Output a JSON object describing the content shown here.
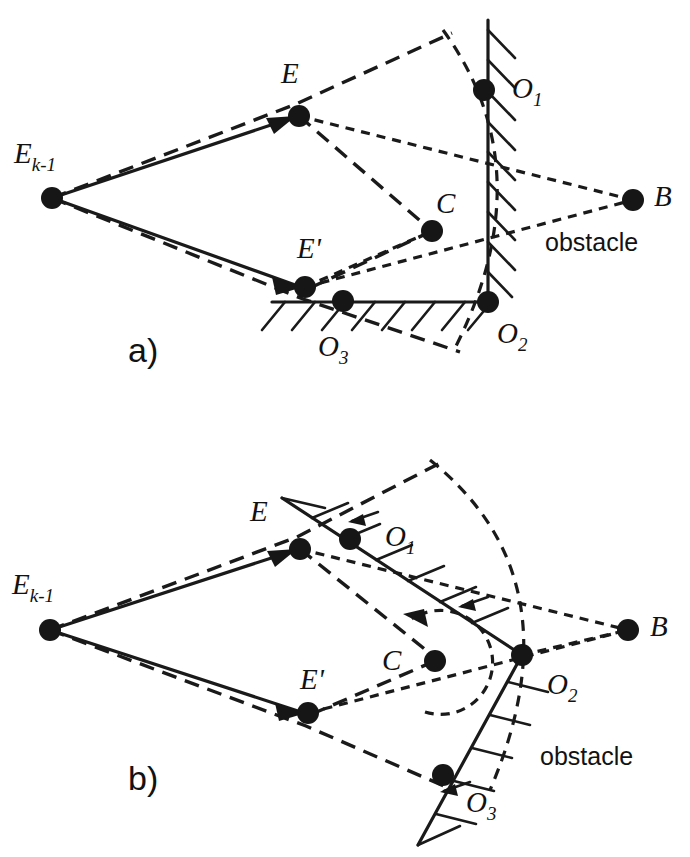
{
  "figure": {
    "background_color": "#ffffff",
    "ink_color": "#161616",
    "panels": [
      {
        "id": "a",
        "label": "a)",
        "label_pos": [
          128,
          362
        ],
        "obstacle_text": "obstacle",
        "obstacle_text_pos": [
          545,
          251
        ],
        "obstacle_shape": "L-corner, vertical arm with hatching on right, horizontal arm with hatching below",
        "nodes": [
          {
            "name": "E_k-1",
            "label": "E",
            "sub": "k-1",
            "x": 52,
            "y": 198,
            "label_x": 14,
            "label_y": 163,
            "r": 10
          },
          {
            "name": "E",
            "label": "E",
            "sub": "",
            "x": 299,
            "y": 116,
            "label_x": 281,
            "label_y": 83,
            "r": 11
          },
          {
            "name": "E_prime",
            "label": "E'",
            "sub": "",
            "x": 305,
            "y": 287,
            "label_x": 297,
            "label_y": 258,
            "r": 11
          },
          {
            "name": "C",
            "label": "C",
            "sub": "",
            "x": 432,
            "y": 231,
            "label_x": 436,
            "label_y": 213,
            "r": 11
          },
          {
            "name": "O_1",
            "label": "O",
            "sub": "1",
            "x": 484,
            "y": 90,
            "label_x": 512,
            "label_y": 98,
            "r": 11
          },
          {
            "name": "O_2",
            "label": "O",
            "sub": "2",
            "x": 488,
            "y": 302,
            "label_x": 497,
            "label_y": 343,
            "r": 11
          },
          {
            "name": "O_3",
            "label": "O",
            "sub": "3",
            "x": 343,
            "y": 301,
            "label_x": 318,
            "label_y": 356,
            "r": 11
          },
          {
            "name": "B",
            "label": "B",
            "sub": "",
            "x": 633,
            "y": 200,
            "label_x": 654,
            "label_y": 206,
            "r": 11
          }
        ]
      },
      {
        "id": "b",
        "label": "b)",
        "label_pos": [
          128,
          790
        ],
        "obstacle_text": "obstacle",
        "obstacle_text_pos": [
          540,
          765
        ],
        "obstacle_shape": "rotated V-corner at O_2, upper arm through O_1, lower arm through O_3, hatching outward",
        "rotation_arrow": "counterclockwise dashed circular arrow around C",
        "nodes": [
          {
            "name": "E_k-1",
            "label": "E",
            "sub": "k-1",
            "x": 50,
            "y": 630,
            "label_x": 12,
            "label_y": 594,
            "r": 10
          },
          {
            "name": "E",
            "label": "E",
            "sub": "",
            "x": 300,
            "y": 549,
            "label_x": 250,
            "label_y": 521,
            "r": 11
          },
          {
            "name": "E_prime",
            "label": "E'",
            "sub": "",
            "x": 308,
            "y": 713,
            "label_x": 300,
            "label_y": 689,
            "r": 11
          },
          {
            "name": "C",
            "label": "C",
            "sub": "",
            "x": 435,
            "y": 661,
            "label_x": 382,
            "label_y": 670,
            "r": 11
          },
          {
            "name": "O_1",
            "label": "O",
            "sub": "1",
            "x": 350,
            "y": 539,
            "label_x": 385,
            "label_y": 546,
            "r": 11
          },
          {
            "name": "O_2",
            "label": "O",
            "sub": "2",
            "x": 522,
            "y": 655,
            "label_x": 547,
            "label_y": 694,
            "r": 11
          },
          {
            "name": "O_3",
            "label": "O",
            "sub": "3",
            "x": 443,
            "y": 775,
            "label_x": 466,
            "label_y": 812,
            "r": 11
          },
          {
            "name": "B",
            "label": "B",
            "sub": "",
            "x": 628,
            "y": 630,
            "label_x": 650,
            "label_y": 636,
            "r": 11
          }
        ]
      }
    ]
  }
}
